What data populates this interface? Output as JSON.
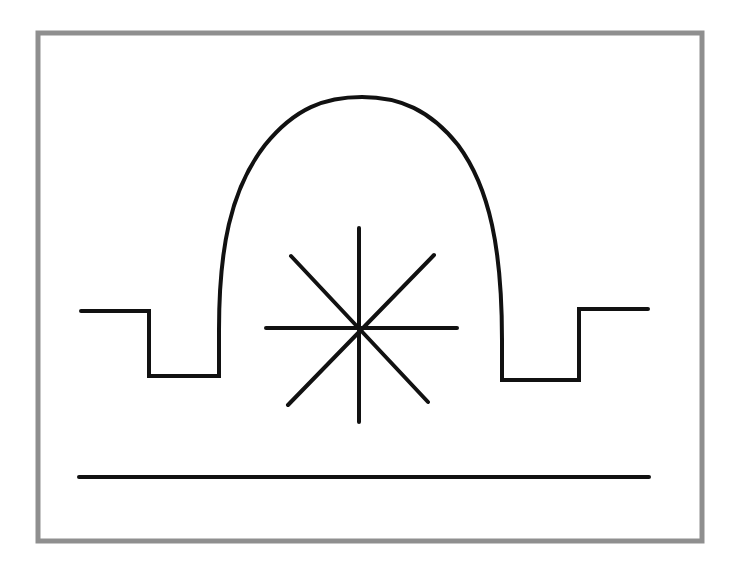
{
  "diagram": {
    "title": "",
    "colors": {
      "background": "#ffffff",
      "frame": "#8f8f8f",
      "ink": "#111111"
    },
    "elements": [
      {
        "id": "frame",
        "type": "rectangle",
        "x": 38,
        "y": 33,
        "width": 664,
        "height": 508
      },
      {
        "id": "left-step",
        "type": "polyline",
        "points": "81,311 149,311 149,376 219,376 219,330"
      },
      {
        "id": "arch",
        "type": "curve",
        "from": [
          219,
          330
        ],
        "apex": [
          362,
          97
        ],
        "to": [
          502,
          340
        ]
      },
      {
        "id": "right-step",
        "type": "polyline",
        "points": "502,340 502,380 579,380 579,309 648,309"
      },
      {
        "id": "star-burst",
        "type": "star",
        "center": [
          359,
          329
        ],
        "rays": 8
      },
      {
        "id": "baseline",
        "type": "line",
        "from": [
          79,
          477
        ],
        "to": [
          649,
          477
        ]
      }
    ]
  }
}
